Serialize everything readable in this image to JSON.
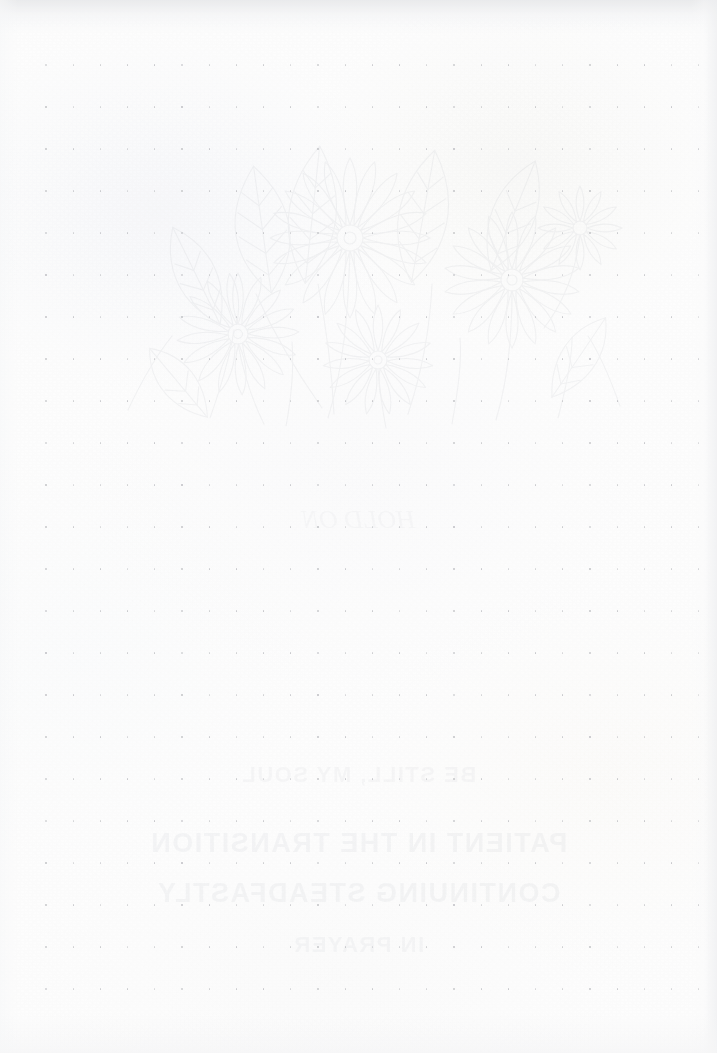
{
  "page": {
    "kind": "scanned-notebook-page",
    "width": 717,
    "height": 1053,
    "paper_color": "#fdfdfd",
    "dot_color": "#b5b6ba"
  },
  "dot_grid": {
    "name": "dot-grid",
    "origin_x": 46,
    "origin_y": 65,
    "spacing_x": 27.2,
    "spacing_y": 42.0,
    "columns": 25,
    "rows": 23,
    "dot_diameter": 1.4,
    "color": "#b5b6ba"
  },
  "show_through": {
    "label": "reverse-side bleed-through",
    "opacity": 0.09,
    "ink_color": "#9aa0ac",
    "artwork": {
      "name": "botanical-line-art",
      "subject": "flowers and leaves",
      "left": 60,
      "top": 88,
      "width": 580,
      "height": 345
    },
    "text_lines": [
      {
        "text": "HOLD ON",
        "top": 505,
        "size": 26,
        "weight": "400",
        "style": "script",
        "opacity": 0.07
      },
      {
        "text": "BE STILL, MY SOUL",
        "top": 762,
        "size": 22,
        "weight": "700",
        "style": "block",
        "opacity": 0.085
      },
      {
        "text": "PATIENT IN THE TRANSITION",
        "top": 828,
        "size": 27,
        "weight": "700",
        "style": "block",
        "opacity": 0.105
      },
      {
        "text": "CONTINUING STEADFASTLY",
        "top": 878,
        "size": 27,
        "weight": "700",
        "style": "block",
        "opacity": 0.1
      },
      {
        "text": "IN PRAYER",
        "top": 932,
        "size": 22,
        "weight": "700",
        "style": "block",
        "opacity": 0.085
      }
    ]
  },
  "content": {
    "written_text": "",
    "note": "The recto surface of the page is blank"
  }
}
